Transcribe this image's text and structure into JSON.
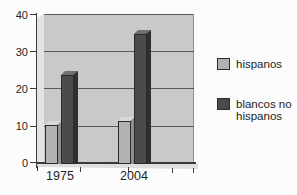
{
  "chart_data": {
    "type": "bar",
    "style": "3d-column",
    "title": "",
    "categories": [
      "1975",
      "2004"
    ],
    "series": [
      {
        "name": "hispanos",
        "values": [
          10.5,
          11.5
        ],
        "colors": {
          "front": "#b2b2b2",
          "top": "#d9d9d9",
          "side": "#8f8f8f"
        }
      },
      {
        "name": "blancos no hispanos",
        "values": [
          24,
          35
        ],
        "colors": {
          "front": "#4b4b4b",
          "top": "#6f6f6f",
          "side": "#2f2f2f"
        }
      }
    ],
    "ylim": [
      0,
      40
    ],
    "yticks": [
      "0",
      "10",
      "20",
      "30",
      "40"
    ],
    "grid": true,
    "legend_position": "right",
    "palette": {
      "wall": "#c9c9c9",
      "wall_side": "#e3e3e3",
      "floor": "#dedede",
      "gridline": "#5a5a5a",
      "axis": "#3c3c3c",
      "text": "#242424",
      "background": "#fcfcfc"
    }
  }
}
